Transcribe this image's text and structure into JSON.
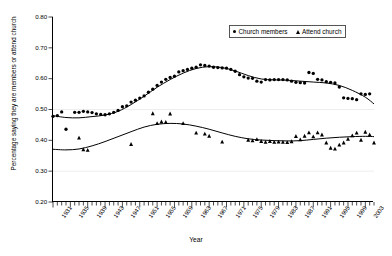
{
  "chart_data": {
    "type": "scatter",
    "title": "",
    "xlabel": "Year",
    "ylabel": "Percentage saying they are members or attend church",
    "xlim": [
      1931,
      2005
    ],
    "ylim": [
      0.2,
      0.8
    ],
    "grid": false,
    "legend_position": "top-right",
    "y_ticks": [
      "0.20",
      "0.30",
      "0.40",
      "0.50",
      "0.60",
      "0.70",
      "0.80"
    ],
    "y_tick_values": [
      0.2,
      0.3,
      0.4,
      0.5,
      0.6,
      0.7,
      0.8
    ],
    "x_ticks": [
      "1931",
      "1935",
      "1939",
      "1943",
      "1947",
      "1951",
      "1955",
      "1959",
      "1963",
      "1967",
      "1971",
      "1975",
      "1979",
      "1983",
      "1987",
      "1991",
      "1995",
      "1999",
      "2003"
    ],
    "x_tick_values": [
      1931,
      1935,
      1939,
      1943,
      1947,
      1951,
      1955,
      1959,
      1963,
      1967,
      1971,
      1975,
      1979,
      1983,
      1987,
      1991,
      1995,
      1999,
      2003
    ],
    "x_minor_tick_step": 1,
    "marker_color": "#000000",
    "line_color": "#000000",
    "series": [
      {
        "name": "Church members",
        "marker": "circle",
        "points": [
          [
            1931,
            0.478
          ],
          [
            1932,
            0.48
          ],
          [
            1933,
            0.492
          ],
          [
            1934,
            0.436
          ],
          [
            1936,
            0.491
          ],
          [
            1937,
            0.491
          ],
          [
            1938,
            0.494
          ],
          [
            1939,
            0.492
          ],
          [
            1940,
            0.49
          ],
          [
            1941,
            0.486
          ],
          [
            1942,
            0.484
          ],
          [
            1943,
            0.483
          ],
          [
            1944,
            0.486
          ],
          [
            1945,
            0.491
          ],
          [
            1946,
            0.497
          ],
          [
            1947,
            0.509
          ],
          [
            1948,
            0.512
          ],
          [
            1949,
            0.524
          ],
          [
            1950,
            0.53
          ],
          [
            1951,
            0.537
          ],
          [
            1952,
            0.544
          ],
          [
            1953,
            0.556
          ],
          [
            1954,
            0.566
          ],
          [
            1955,
            0.578
          ],
          [
            1956,
            0.589
          ],
          [
            1957,
            0.598
          ],
          [
            1958,
            0.604
          ],
          [
            1959,
            0.608
          ],
          [
            1960,
            0.622
          ],
          [
            1961,
            0.626
          ],
          [
            1962,
            0.63
          ],
          [
            1963,
            0.634
          ],
          [
            1964,
            0.637
          ],
          [
            1965,
            0.645
          ],
          [
            1966,
            0.643
          ],
          [
            1967,
            0.641
          ],
          [
            1968,
            0.637
          ],
          [
            1969,
            0.636
          ],
          [
            1970,
            0.635
          ],
          [
            1971,
            0.634
          ],
          [
            1972,
            0.63
          ],
          [
            1973,
            0.624
          ],
          [
            1974,
            0.613
          ],
          [
            1975,
            0.606
          ],
          [
            1976,
            0.602
          ],
          [
            1977,
            0.601
          ],
          [
            1978,
            0.592
          ],
          [
            1979,
            0.589
          ],
          [
            1980,
            0.597
          ],
          [
            1981,
            0.596
          ],
          [
            1982,
            0.597
          ],
          [
            1983,
            0.597
          ],
          [
            1984,
            0.597
          ],
          [
            1985,
            0.596
          ],
          [
            1986,
            0.592
          ],
          [
            1987,
            0.588
          ],
          [
            1988,
            0.587
          ],
          [
            1989,
            0.586
          ],
          [
            1990,
            0.62
          ],
          [
            1991,
            0.617
          ],
          [
            1992,
            0.598
          ],
          [
            1993,
            0.596
          ],
          [
            1994,
            0.59
          ],
          [
            1995,
            0.588
          ],
          [
            1996,
            0.586
          ],
          [
            1997,
            0.573
          ],
          [
            1998,
            0.538
          ],
          [
            1999,
            0.536
          ],
          [
            2000,
            0.535
          ],
          [
            2001,
            0.532
          ],
          [
            2002,
            0.551
          ],
          [
            2003,
            0.549
          ],
          [
            2004,
            0.551
          ]
        ],
        "fit_line": [
          [
            1931,
            0.48
          ],
          [
            1934,
            0.474
          ],
          [
            1937,
            0.473
          ],
          [
            1940,
            0.477
          ],
          [
            1943,
            0.482
          ],
          [
            1946,
            0.494
          ],
          [
            1949,
            0.516
          ],
          [
            1952,
            0.543
          ],
          [
            1955,
            0.572
          ],
          [
            1958,
            0.597
          ],
          [
            1961,
            0.618
          ],
          [
            1964,
            0.633
          ],
          [
            1967,
            0.639
          ],
          [
            1970,
            0.636
          ],
          [
            1973,
            0.625
          ],
          [
            1976,
            0.61
          ],
          [
            1979,
            0.599
          ],
          [
            1982,
            0.596
          ],
          [
            1985,
            0.595
          ],
          [
            1988,
            0.592
          ],
          [
            1991,
            0.589
          ],
          [
            1994,
            0.586
          ],
          [
            1997,
            0.578
          ],
          [
            2000,
            0.562
          ],
          [
            2003,
            0.54
          ],
          [
            2005,
            0.518
          ]
        ]
      },
      {
        "name": "Attend church",
        "marker": "triangle",
        "points": [
          [
            1937,
            0.408
          ],
          [
            1938,
            0.37
          ],
          [
            1939,
            0.368
          ],
          [
            1949,
            0.387
          ],
          [
            1954,
            0.487
          ],
          [
            1955,
            0.455
          ],
          [
            1956,
            0.46
          ],
          [
            1957,
            0.459
          ],
          [
            1958,
            0.486
          ],
          [
            1961,
            0.455
          ],
          [
            1964,
            0.424
          ],
          [
            1966,
            0.421
          ],
          [
            1967,
            0.414
          ],
          [
            1970,
            0.395
          ],
          [
            1976,
            0.401
          ],
          [
            1977,
            0.399
          ],
          [
            1978,
            0.403
          ],
          [
            1979,
            0.397
          ],
          [
            1980,
            0.394
          ],
          [
            1981,
            0.397
          ],
          [
            1982,
            0.394
          ],
          [
            1983,
            0.395
          ],
          [
            1984,
            0.394
          ],
          [
            1985,
            0.393
          ],
          [
            1986,
            0.396
          ],
          [
            1987,
            0.413
          ],
          [
            1988,
            0.402
          ],
          [
            1989,
            0.414
          ],
          [
            1990,
            0.425
          ],
          [
            1991,
            0.412
          ],
          [
            1992,
            0.425
          ],
          [
            1993,
            0.418
          ],
          [
            1994,
            0.392
          ],
          [
            1995,
            0.375
          ],
          [
            1996,
            0.372
          ],
          [
            1997,
            0.385
          ],
          [
            1998,
            0.392
          ],
          [
            1999,
            0.404
          ],
          [
            2000,
            0.415
          ],
          [
            2001,
            0.424
          ],
          [
            2002,
            0.401
          ],
          [
            2003,
            0.427
          ],
          [
            2004,
            0.418
          ],
          [
            2005,
            0.392
          ]
        ],
        "fit_line": [
          [
            1931,
            0.371
          ],
          [
            1934,
            0.369
          ],
          [
            1937,
            0.372
          ],
          [
            1940,
            0.382
          ],
          [
            1943,
            0.396
          ],
          [
            1946,
            0.412
          ],
          [
            1949,
            0.428
          ],
          [
            1952,
            0.443
          ],
          [
            1955,
            0.452
          ],
          [
            1958,
            0.455
          ],
          [
            1961,
            0.453
          ],
          [
            1964,
            0.446
          ],
          [
            1967,
            0.436
          ],
          [
            1970,
            0.424
          ],
          [
            1973,
            0.413
          ],
          [
            1976,
            0.405
          ],
          [
            1979,
            0.401
          ],
          [
            1982,
            0.399
          ],
          [
            1985,
            0.398
          ],
          [
            1988,
            0.399
          ],
          [
            1991,
            0.403
          ],
          [
            1994,
            0.407
          ],
          [
            1997,
            0.41
          ],
          [
            2000,
            0.412
          ],
          [
            2003,
            0.413
          ],
          [
            2005,
            0.412
          ]
        ]
      }
    ]
  },
  "legend": {
    "entries": [
      {
        "label": "Church members",
        "marker": "circle"
      },
      {
        "label": "Attend church",
        "marker": "triangle"
      }
    ]
  }
}
